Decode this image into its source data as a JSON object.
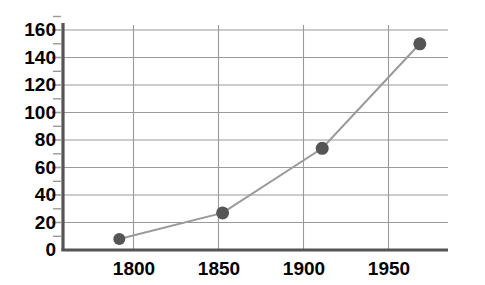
{
  "chart_data": {
    "type": "line",
    "title": "",
    "subtitle": "",
    "xlabel": "",
    "ylabel": "",
    "xlim": [
      1770,
      1975
    ],
    "ylim": [
      0,
      165
    ],
    "grid": true,
    "legend": null,
    "x_ticks": [
      1800,
      1850,
      1900,
      1950
    ],
    "x_tick_labels": [
      "1800",
      "1850",
      "1900",
      "1950"
    ],
    "y_ticks": [
      0,
      20,
      40,
      60,
      80,
      100,
      120,
      140,
      160
    ],
    "y_tick_labels": [
      "0",
      "20",
      "40",
      "60",
      "80",
      "100",
      "120",
      "140",
      "160"
    ],
    "y_minor_ticks": [
      10,
      30,
      50,
      70,
      90,
      110,
      130,
      150
    ],
    "series": [
      {
        "name": "series-1",
        "marker": "circle",
        "marker_color": "#555555",
        "line_color": "#9a9a9a",
        "x": [
          1800,
          1855,
          1908,
          1960
        ],
        "y": [
          8,
          27,
          74,
          150
        ],
        "points": [
          {
            "x": 1800,
            "y": 8
          },
          {
            "x": 1855,
            "y": 27
          },
          {
            "x": 1908,
            "y": 74
          },
          {
            "x": 1960,
            "y": 150
          }
        ]
      }
    ],
    "colors": {
      "axis": "#555555",
      "grid": "#9a9a9a",
      "marker": "#555555",
      "line": "#9a9a9a",
      "text": "#000000",
      "background": "#ffffff"
    }
  },
  "axes": {
    "y_axis_name": "y-axis",
    "x_axis_name": "x-axis"
  }
}
